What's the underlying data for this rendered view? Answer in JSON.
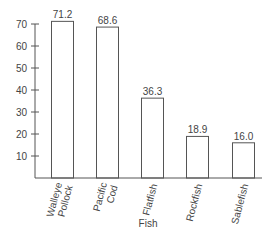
{
  "chart_data": {
    "type": "bar",
    "title": "",
    "xlabel": "Fish",
    "ylabel": "",
    "categories": [
      [
        "Walleye",
        "Pollock"
      ],
      [
        "Pacific",
        "Cod"
      ],
      [
        "Flatfish"
      ],
      [
        "Rockfish"
      ],
      [
        "Sablefish"
      ]
    ],
    "category_names": [
      "Walleye Pollock",
      "Pacific Cod",
      "Flatfish",
      "Rockfish",
      "Sablefish"
    ],
    "values": [
      71.2,
      68.6,
      36.3,
      18.9,
      16.0
    ],
    "value_labels": [
      "71.2",
      "68.6",
      "36.3",
      "18.9",
      "16.0"
    ],
    "yticks": [
      10,
      20,
      30,
      40,
      50,
      60,
      70
    ],
    "ylim": [
      0,
      70
    ],
    "grid": false,
    "legend": null,
    "bar_fill": "#ffffff",
    "bar_stroke": "#555555"
  }
}
